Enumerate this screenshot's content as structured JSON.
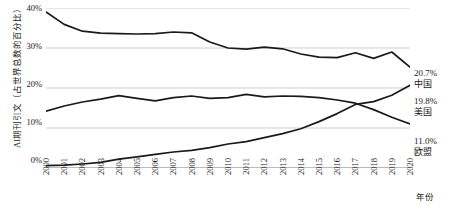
{
  "chart_data": {
    "type": "line",
    "title": "",
    "xlabel": "年份",
    "ylabel": "AI期刊引文（占世界总数的百分比）",
    "categories": [
      "2000",
      "2001",
      "2002",
      "2003",
      "2004",
      "2005",
      "2006",
      "2007",
      "2008",
      "2009",
      "2010",
      "2011",
      "2012",
      "2013",
      "2014",
      "2015",
      "2016",
      "2017",
      "2018",
      "2019",
      "2020"
    ],
    "xlim": [
      2000,
      2020
    ],
    "ylim": [
      0,
      40
    ],
    "ytick_labels": [
      "0%",
      "10%",
      "20%",
      "30%",
      "40%"
    ],
    "ytick_values": [
      0,
      10,
      20,
      30,
      40
    ],
    "grid": "horizontal",
    "legend": "end-of-line labels",
    "series": [
      {
        "name": "美国",
        "end_value_label": "19.8%",
        "values": [
          39.0,
          35.9,
          34.2,
          33.7,
          33.6,
          33.5,
          33.6,
          34.0,
          33.8,
          31.5,
          30.0,
          29.7,
          30.2,
          29.8,
          28.5,
          27.7,
          27.6,
          28.8,
          27.4,
          29.0,
          25.2
        ]
      },
      {
        "name": "欧盟",
        "end_value_label": "11.0%",
        "values": [
          14.2,
          15.5,
          16.5,
          17.2,
          18.1,
          17.4,
          16.8,
          17.6,
          18.0,
          17.4,
          17.6,
          18.4,
          17.8,
          18.0,
          17.9,
          17.6,
          17.0,
          16.2,
          14.6,
          12.7,
          11.0
        ]
      },
      {
        "name": "中国",
        "end_value_label": "20.7%",
        "values": [
          0.6,
          0.7,
          1.0,
          1.4,
          2.2,
          2.8,
          3.4,
          4.0,
          4.4,
          5.1,
          6.0,
          6.6,
          7.6,
          8.6,
          9.8,
          11.6,
          13.6,
          15.9,
          16.6,
          18.2,
          20.7
        ]
      }
    ],
    "series_order_top_to_bottom_at_end": [
      "中国",
      "美国",
      "欧盟"
    ],
    "line_color": "#1a1a1a",
    "grid_color": "#c9c9c9",
    "axis_color": "#8a8a8a",
    "background": "#ffffff"
  },
  "labels": {
    "china_value": "20.7%",
    "china_name": "中国",
    "usa_value": "19.8%",
    "usa_name": "美国",
    "eu_value": "11.0%",
    "eu_name": "欧盟"
  },
  "axes": {
    "y_title": "AI期刊引文（占世界总数的百分比）",
    "x_title": "年份",
    "y_ticks": [
      "40%",
      "30%",
      "20%",
      "10%",
      "0%"
    ],
    "x_ticks": [
      "2000",
      "2001",
      "2002",
      "2003",
      "2004",
      "2005",
      "2006",
      "2007",
      "2008",
      "2009",
      "2010",
      "2011",
      "2012",
      "2013",
      "2014",
      "2015",
      "2016",
      "2017",
      "2018",
      "2019",
      "2020"
    ]
  }
}
